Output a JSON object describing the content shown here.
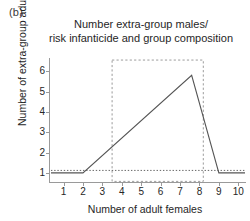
{
  "panel": {
    "label": "(b)"
  },
  "chart_data": {
    "type": "line",
    "title": "Number extra-group males/ risk infanticide and group composition",
    "title_lines": [
      "Number extra-group males/",
      "risk infanticide and group composition"
    ],
    "xlabel": "Number of adult females",
    "ylabel": "Number of extra-group adult males",
    "xlim": [
      0.3,
      10.4
    ],
    "ylim": [
      0.55,
      6.75
    ],
    "xticks": [
      1,
      2,
      3,
      4,
      5,
      6,
      7,
      8,
      9,
      10
    ],
    "xtick_labels": [
      "1",
      "2",
      "3",
      "4",
      "5",
      "6",
      "7",
      "8",
      "9",
      "10"
    ],
    "yticks": [
      1,
      2,
      3,
      4,
      5,
      6
    ],
    "ytick_labels": [
      "1",
      "2",
      "3",
      "4",
      "5",
      "6"
    ],
    "grid": false,
    "legend": "none",
    "series": [
      {
        "name": "Number of extra-group adult males",
        "style": "solid",
        "color": "#555555",
        "x": [
          0.35,
          2.0,
          7.6,
          9.0,
          10.35
        ],
        "y": [
          1.0,
          1.0,
          5.8,
          1.0,
          1.0
        ]
      }
    ],
    "annotations": [
      {
        "kind": "reference-line",
        "orientation": "horizontal",
        "style": "dotted",
        "color": "#666666",
        "y": 1.12,
        "x_start": 0.35,
        "x_end": 10.35
      },
      {
        "kind": "highlight-box",
        "style": "dashed",
        "color": "#9b9b9b",
        "x_start": 3.5,
        "x_end": 8.2,
        "y_bottom": 0.58,
        "y_top": 6.55
      }
    ]
  }
}
